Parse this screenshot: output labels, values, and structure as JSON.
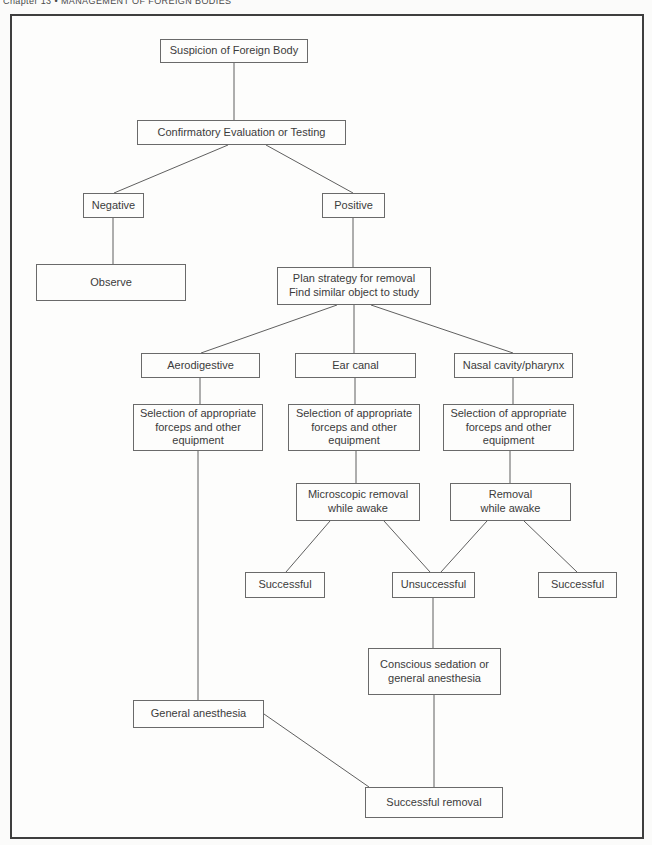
{
  "header": {
    "running_title": "Chapter 13 • MANAGEMENT OF FOREIGN BODIES"
  },
  "diagram": {
    "colors": {
      "frame_border": "#3e3e3e",
      "box_border": "#6a6a6a",
      "line": "#5f5f5f",
      "text": "#3b3b3b",
      "background": "#fdfdfc"
    },
    "nodes": [
      {
        "id": "suspicion",
        "label": "Suspicion of Foreign Body",
        "x": 160,
        "y": 39,
        "w": 148,
        "h": 24
      },
      {
        "id": "confirmatory",
        "label": "Confirmatory Evaluation or Testing",
        "x": 137,
        "y": 120,
        "w": 209,
        "h": 25
      },
      {
        "id": "negative",
        "label": "Negative",
        "x": 83,
        "y": 193,
        "w": 61,
        "h": 25
      },
      {
        "id": "positive",
        "label": "Positive",
        "x": 322,
        "y": 193,
        "w": 63,
        "h": 25
      },
      {
        "id": "observe",
        "label": "Observe",
        "x": 36,
        "y": 264,
        "w": 150,
        "h": 37
      },
      {
        "id": "plan-strategy",
        "label": "Plan strategy for removal\nFind similar object to study",
        "x": 277,
        "y": 267,
        "w": 154,
        "h": 38
      },
      {
        "id": "aerodigestive",
        "label": "Aerodigestive",
        "x": 141,
        "y": 353,
        "w": 119,
        "h": 25
      },
      {
        "id": "ear-canal",
        "label": "Ear canal",
        "x": 295,
        "y": 353,
        "w": 121,
        "h": 25
      },
      {
        "id": "nasal-cavity",
        "label": "Nasal cavity/pharynx",
        "x": 454,
        "y": 353,
        "w": 119,
        "h": 25
      },
      {
        "id": "selection-aero",
        "label": "Selection of appropriate\nforceps and other\nequipment",
        "x": 133,
        "y": 404,
        "w": 130,
        "h": 47
      },
      {
        "id": "selection-ear",
        "label": "Selection of appropriate\nforceps and other\nequipment",
        "x": 288,
        "y": 404,
        "w": 132,
        "h": 47
      },
      {
        "id": "selection-nasal",
        "label": "Selection of appropriate\nforceps and other\nequipment",
        "x": 443,
        "y": 404,
        "w": 131,
        "h": 47
      },
      {
        "id": "microscopic-removal",
        "label": "Microscopic removal\nwhile awake",
        "x": 296,
        "y": 483,
        "w": 124,
        "h": 38
      },
      {
        "id": "removal-awake",
        "label": "Removal\nwhile awake",
        "x": 450,
        "y": 483,
        "w": 121,
        "h": 38
      },
      {
        "id": "successful-left",
        "label": "Successful",
        "x": 245,
        "y": 572,
        "w": 80,
        "h": 26
      },
      {
        "id": "unsuccessful",
        "label": "Unsuccessful",
        "x": 392,
        "y": 572,
        "w": 83,
        "h": 26
      },
      {
        "id": "successful-right",
        "label": "Successful",
        "x": 538,
        "y": 572,
        "w": 79,
        "h": 26
      },
      {
        "id": "conscious-sedation",
        "label": "Conscious sedation or\ngeneral anesthesia",
        "x": 368,
        "y": 648,
        "w": 133,
        "h": 47
      },
      {
        "id": "general-anesthesia",
        "label": "General anesthesia",
        "x": 133,
        "y": 700,
        "w": 131,
        "h": 28
      },
      {
        "id": "successful-removal",
        "label": "Successful removal",
        "x": 365,
        "y": 787,
        "w": 138,
        "h": 31
      }
    ],
    "edges": [
      {
        "x1": 234,
        "y1": 63,
        "x2": 234,
        "y2": 120
      },
      {
        "x1": 228,
        "y1": 145,
        "x2": 114,
        "y2": 193
      },
      {
        "x1": 266,
        "y1": 145,
        "x2": 353,
        "y2": 193
      },
      {
        "x1": 113,
        "y1": 218,
        "x2": 113,
        "y2": 264
      },
      {
        "x1": 353,
        "y1": 218,
        "x2": 353,
        "y2": 267
      },
      {
        "x1": 337,
        "y1": 305,
        "x2": 201,
        "y2": 353
      },
      {
        "x1": 354,
        "y1": 305,
        "x2": 354,
        "y2": 353
      },
      {
        "x1": 371,
        "y1": 305,
        "x2": 513,
        "y2": 353
      },
      {
        "x1": 200,
        "y1": 378,
        "x2": 200,
        "y2": 404
      },
      {
        "x1": 355,
        "y1": 378,
        "x2": 355,
        "y2": 404
      },
      {
        "x1": 513,
        "y1": 378,
        "x2": 513,
        "y2": 404
      },
      {
        "x1": 356,
        "y1": 451,
        "x2": 356,
        "y2": 483
      },
      {
        "x1": 510,
        "y1": 451,
        "x2": 510,
        "y2": 483
      },
      {
        "x1": 198,
        "y1": 451,
        "x2": 198,
        "y2": 700
      },
      {
        "x1": 330,
        "y1": 521,
        "x2": 286,
        "y2": 572
      },
      {
        "x1": 384,
        "y1": 521,
        "x2": 430,
        "y2": 572
      },
      {
        "x1": 487,
        "y1": 521,
        "x2": 441,
        "y2": 572
      },
      {
        "x1": 524,
        "y1": 521,
        "x2": 577,
        "y2": 572
      },
      {
        "x1": 433,
        "y1": 598,
        "x2": 433,
        "y2": 648
      },
      {
        "x1": 434,
        "y1": 695,
        "x2": 434,
        "y2": 787
      },
      {
        "x1": 264,
        "y1": 714,
        "x2": 369,
        "y2": 787
      }
    ]
  }
}
